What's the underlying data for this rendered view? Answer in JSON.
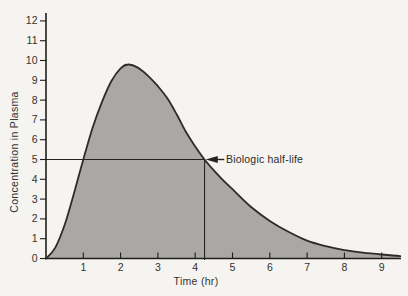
{
  "figure": {
    "kind": "scanned-textbook-pharmacokinetics-figure"
  },
  "chart_data": {
    "type": "area",
    "title": "",
    "xlabel": "Time (hr)",
    "ylabel": "Concentration in Plasma",
    "xlim": [
      0,
      9.6
    ],
    "ylim": [
      0,
      12.6
    ],
    "x_ticks": [
      1,
      2,
      3,
      4,
      5,
      6,
      7,
      8,
      9
    ],
    "y_ticks": [
      0,
      1,
      2,
      3,
      4,
      5,
      6,
      7,
      8,
      9,
      10,
      11,
      12
    ],
    "grid": false,
    "legend_position": "none",
    "series": [
      {
        "name": "plasma-concentration",
        "points": [
          [
            0,
            0
          ],
          [
            0.25,
            0.55
          ],
          [
            0.5,
            1.7
          ],
          [
            0.75,
            3.3
          ],
          [
            1,
            5.0
          ],
          [
            1.25,
            6.6
          ],
          [
            1.5,
            7.9
          ],
          [
            1.75,
            8.95
          ],
          [
            2,
            9.6
          ],
          [
            2.2,
            9.8
          ],
          [
            2.45,
            9.65
          ],
          [
            2.75,
            9.2
          ],
          [
            3,
            8.7
          ],
          [
            3.25,
            8.1
          ],
          [
            3.5,
            7.3
          ],
          [
            3.75,
            6.4
          ],
          [
            4,
            5.65
          ],
          [
            4.25,
            5.0
          ],
          [
            4.5,
            4.45
          ],
          [
            4.75,
            3.95
          ],
          [
            5,
            3.5
          ],
          [
            5.5,
            2.6
          ],
          [
            6,
            1.9
          ],
          [
            6.5,
            1.35
          ],
          [
            7,
            0.9
          ],
          [
            7.5,
            0.62
          ],
          [
            8,
            0.42
          ],
          [
            8.5,
            0.3
          ],
          [
            9,
            0.2
          ],
          [
            9.5,
            0.12
          ]
        ],
        "peak": {
          "x": 2.2,
          "y": 9.8
        }
      }
    ],
    "annotations": {
      "half_life": {
        "label": "Biologic half-life",
        "x": 4.25,
        "y": 5,
        "hline": {
          "y": 5,
          "from_x": 0,
          "to_x": 4.25
        },
        "vline": {
          "x": 4.25,
          "from_y": 0,
          "to_y": 5
        }
      }
    },
    "colors": {
      "fill": "#aaa8a5",
      "curve_stroke": "#2e2c2a",
      "axis": "#1e1d1b",
      "ref_line": "#242321",
      "text": "#33322f",
      "background": "#f5f4f1"
    }
  }
}
